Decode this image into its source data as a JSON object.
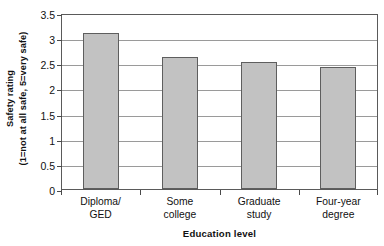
{
  "chart_data": {
    "type": "bar",
    "title": "",
    "categories": [
      "Diploma/ GED",
      "Some college",
      "Graduate study",
      "Four-year degree"
    ],
    "category_lines": [
      [
        "Diploma/",
        "GED"
      ],
      [
        "Some",
        "college"
      ],
      [
        "Graduate",
        "study"
      ],
      [
        "Four-year",
        "degree"
      ]
    ],
    "values": [
      3.11,
      2.62,
      2.53,
      2.43
    ],
    "xlabel": "Education level",
    "ylabel": "Safety rating",
    "ylabel_line2": "(1=not at all safe, 5=very safe)",
    "ylim": [
      0,
      3.5
    ],
    "yticks": [
      0,
      0.5,
      1,
      1.5,
      2,
      2.5,
      3,
      3.5
    ],
    "ytick_labels": [
      "0",
      "0.5",
      "1",
      "1.5",
      "2",
      "2.5",
      "3",
      "3.5"
    ],
    "grid": true,
    "legend": null,
    "bar_color": "#c2c2c2",
    "bar_edge_color": "#5e5e5e",
    "grid_color": "#9a9a9a",
    "axis_color": "#5a5a5a"
  }
}
